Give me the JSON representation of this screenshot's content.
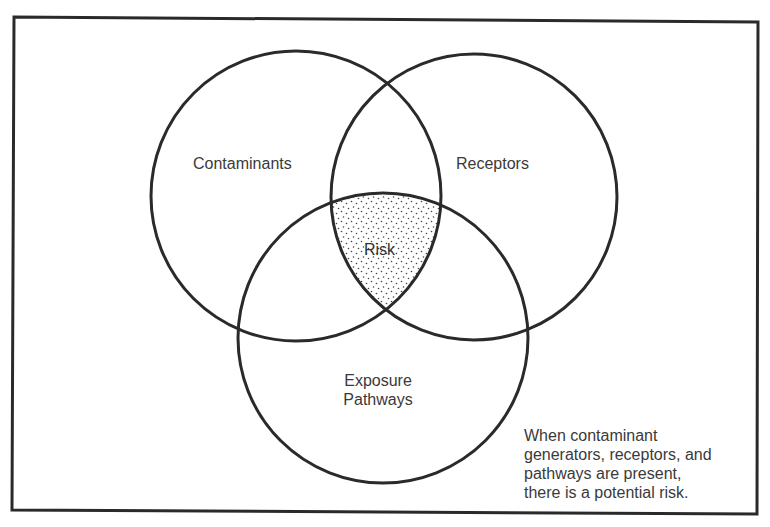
{
  "diagram": {
    "type": "venn",
    "sets": [
      {
        "id": "contaminants",
        "label": "Contaminants"
      },
      {
        "id": "receptors",
        "label": "Receptors"
      },
      {
        "id": "exposure_pathways",
        "label_line1": "Exposure",
        "label_line2": "Pathways"
      }
    ],
    "intersection": {
      "label": "Risk",
      "fill": "stippled"
    },
    "note": {
      "lines": [
        "When contaminant",
        "generators, receptors, and",
        "pathways are present,",
        "there is a potential risk."
      ]
    },
    "colors": {
      "stroke": "#2a2a2a",
      "text": "#3a3a3a",
      "background": "#ffffff"
    }
  }
}
